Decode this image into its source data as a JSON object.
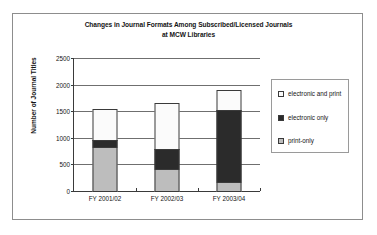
{
  "chart_data": {
    "type": "bar",
    "stacked": true,
    "title": "Changes in Journal Formats Among Subscribed/Licensed Journals at MCW Libraries",
    "title_line1": "Changes in Journal Formats Among Subscribed/Licensed Journals",
    "title_line2": "at MCW Libraries",
    "xlabel": "",
    "ylabel": "Number of Journal Titles",
    "categories": [
      "FY 2001/02",
      "FY 2002/03",
      "FY 2003/04"
    ],
    "ylim": [
      0,
      2500
    ],
    "yticks": [
      0,
      500,
      1000,
      1500,
      2000,
      2500
    ],
    "ytick_labels": [
      "0",
      "500",
      "1000",
      "1500",
      "2000",
      "2500"
    ],
    "grid": true,
    "legend_position": "right",
    "series": [
      {
        "name": "print-only",
        "color": "#bdbdbd",
        "values": [
          850,
          430,
          195
        ]
      },
      {
        "name": "electronic only",
        "color": "#2b2b2b",
        "values": [
          150,
          400,
          1365
        ]
      },
      {
        "name": "electronic and print",
        "color": "#fbfbfb",
        "values": [
          600,
          880,
          400
        ]
      }
    ],
    "totals": [
      1600,
      1710,
      1960
    ],
    "legend_order": [
      "electronic and print",
      "electronic only",
      "print-only"
    ]
  }
}
